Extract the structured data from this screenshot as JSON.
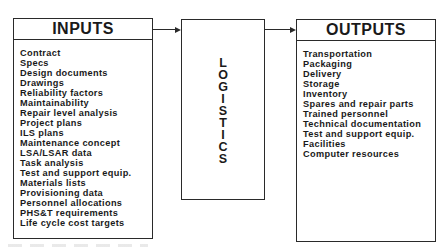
{
  "diagram": {
    "inputs": {
      "title": "INPUTS",
      "items": [
        "Contract",
        "Specs",
        "Design documents",
        "Drawings",
        "Reliability factors",
        "Maintainability",
        "Repair level analysis",
        "Project plans",
        "ILS plans",
        "Maintenance concept",
        "LSA/LSAR data",
        "Task analysis",
        "Test and support equip.",
        "Materials lists",
        "Provisioning data",
        "Personnel allocations",
        "PHS&T requirements",
        "Life cycle cost targets"
      ]
    },
    "process": {
      "title": "LOGISTICS",
      "letters": [
        "L",
        "O",
        "G",
        "I",
        "S",
        "T",
        "I",
        "C",
        "S"
      ]
    },
    "outputs": {
      "title": "OUTPUTS",
      "items": [
        "Transportation",
        "Packaging",
        "Delivery",
        "Storage",
        "Inventory",
        "Spares and repair parts",
        "Trained personnel",
        "Technical documentation",
        "Test and support equip.",
        "Facilities",
        "Computer resources"
      ]
    },
    "connections": [
      {
        "from": "INPUTS",
        "to": "LOGISTICS",
        "arrow": true
      },
      {
        "from": "LOGISTICS",
        "to": "OUTPUTS",
        "arrow": true
      }
    ],
    "colors": {
      "stroke": "#2a2a2a",
      "text": "#1a1a1a",
      "background": "#ffffff"
    }
  }
}
